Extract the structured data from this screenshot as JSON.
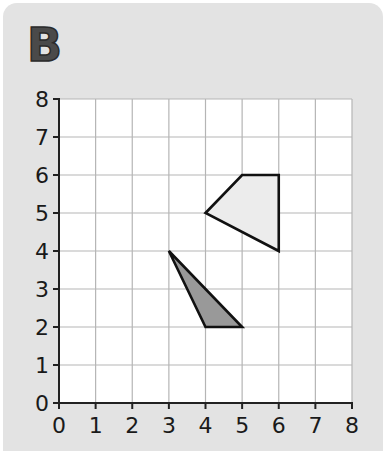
{
  "panel_label": "B",
  "colors": {
    "background": "#e3e3e3",
    "grid_fill": "#ffffff",
    "grid_line": "#b5b5b5",
    "axis": "#222222",
    "quad_fill": "#ececec",
    "triangle_fill": "#999999",
    "outline": "#111111"
  },
  "axes": {
    "x_ticks": [
      "0",
      "1",
      "2",
      "3",
      "4",
      "5",
      "6",
      "7",
      "8"
    ],
    "y_ticks": [
      "0",
      "1",
      "2",
      "3",
      "4",
      "5",
      "6",
      "7",
      "8"
    ],
    "xlim": [
      0,
      8
    ],
    "ylim": [
      0,
      8
    ]
  },
  "shapes": [
    {
      "name": "quadrilateral",
      "points": [
        [
          4,
          5
        ],
        [
          5,
          6
        ],
        [
          6,
          6
        ],
        [
          6,
          4
        ]
      ],
      "fill": "#ececec"
    },
    {
      "name": "triangle",
      "points": [
        [
          3,
          4
        ],
        [
          4,
          2
        ],
        [
          5,
          2
        ]
      ],
      "fill": "#999999"
    }
  ]
}
